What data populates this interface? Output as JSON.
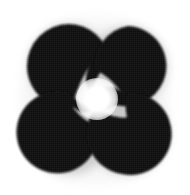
{
  "image": {
    "title": "Illusory contour figure",
    "description": "Four black discs arranged in a two-by-two grid, each with a curved notch cut toward the centre, forming a perceived bright four-pointed star",
    "width": 190,
    "height": 195,
    "background_color": "#ffffff",
    "ink_color": "#0d0d0d",
    "halo_color": "#c8c8c8",
    "center_color": "#ffffff"
  },
  "figure": {
    "type": "kanizsa-style-illusory-star",
    "disc_count": 4,
    "layout": "2x2 grid",
    "discs": [
      {
        "name": "top-left",
        "cx": 69,
        "cy": 66,
        "r": 42,
        "notch_direction": "lower-right",
        "notch_angle_deg": 45
      },
      {
        "name": "top-right",
        "cx": 128,
        "cy": 66,
        "r": 40,
        "notch_direction": "lower-left",
        "notch_angle_deg": 135
      },
      {
        "name": "bottom-left",
        "cx": 69,
        "cy": 134,
        "r": 41,
        "notch_direction": "upper-right",
        "notch_angle_deg": 315
      },
      {
        "name": "bottom-right",
        "cx": 128,
        "cy": 134,
        "r": 41,
        "notch_direction": "upper-left",
        "notch_angle_deg": 225
      }
    ],
    "illusory_shape": {
      "name": "four-pointed-star",
      "cx": 97,
      "cy": 99,
      "radius": 21,
      "color": "#ffffff"
    }
  }
}
